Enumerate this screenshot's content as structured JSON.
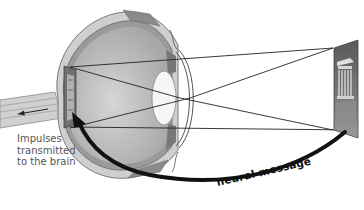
{
  "diagram": {
    "labels": {
      "impulses_line1": "Impulses",
      "impulses_line2": "transmitted",
      "impulses_line3": "to the brain",
      "neural_message": "neural message"
    },
    "elements": [
      "eyeball-cross-section",
      "lens",
      "cornea",
      "retina-inverted-image",
      "optic-nerve",
      "light-rays",
      "object-image-parthenon",
      "neural-message-arrow"
    ],
    "colors": {
      "sclera": "#c8c8c8",
      "vitreous": "#b4b4b4",
      "lens": "#f4f4f4",
      "ray": "#222222",
      "arrow": "#111111",
      "object": "#6e6e6e"
    }
  }
}
